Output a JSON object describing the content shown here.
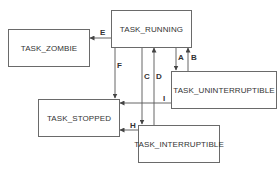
{
  "diagram": {
    "type": "state-transition",
    "states": [
      {
        "id": "running",
        "label": "TASK_RUNNING"
      },
      {
        "id": "zombie",
        "label": "TASK_ZOMBIE"
      },
      {
        "id": "stopped",
        "label": "TASK_STOPPED"
      },
      {
        "id": "uninterruptible",
        "label": "TASK_UNINTERRUPTIBLE"
      },
      {
        "id": "interruptible",
        "label": "TASK_INTERRUPTIBLE"
      }
    ],
    "transitions": [
      {
        "label": "A",
        "from": "TASK_RUNNING",
        "to": "TASK_UNINTERRUPTIBLE"
      },
      {
        "label": "B",
        "from": "TASK_UNINTERRUPTIBLE",
        "to": "TASK_RUNNING"
      },
      {
        "label": "C",
        "from": "TASK_RUNNING",
        "to": "TASK_INTERRUPTIBLE"
      },
      {
        "label": "D",
        "from": "TASK_INTERRUPTIBLE",
        "to": "TASK_RUNNING"
      },
      {
        "label": "E",
        "from": "TASK_RUNNING",
        "to": "TASK_ZOMBIE"
      },
      {
        "label": "F",
        "from": "TASK_RUNNING",
        "to": "TASK_STOPPED"
      },
      {
        "label": "H",
        "from": "TASK_INTERRUPTIBLE",
        "to": "TASK_STOPPED"
      },
      {
        "label": "I",
        "from": "TASK_UNINTERRUPTIBLE",
        "to": "TASK_STOPPED"
      }
    ],
    "colors": {
      "line": "#555555",
      "border": "#6a6a6a",
      "text": "#333333"
    }
  }
}
